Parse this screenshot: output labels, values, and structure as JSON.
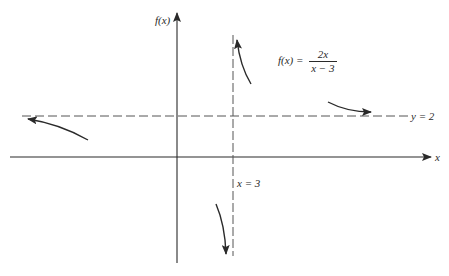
{
  "diagram": {
    "title_function": {
      "lhs": "f(x) =",
      "numerator": "2x",
      "denominator": "x − 3"
    },
    "axes": {
      "y_label": "f(x)",
      "x_label": "x"
    },
    "asymptotes": {
      "horizontal_label": "y = 2",
      "vertical_label": "x = 3"
    },
    "colors": {
      "ink": "#2a2a2a",
      "dash": "#555555",
      "background": "#ffffff"
    }
  }
}
